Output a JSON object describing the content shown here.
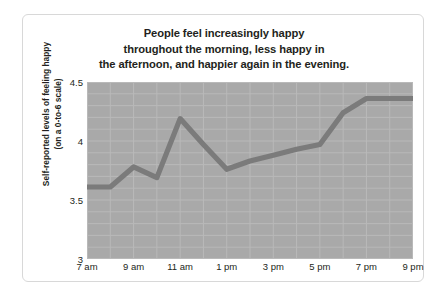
{
  "chart_data": {
    "type": "line",
    "title": "People feel increasingly happy throughout the morning, less happy in the afternoon, and happier again in the evening.",
    "title_lines": [
      "People feel increasingly happy",
      "throughout the morning, less happy in",
      "the afternoon, and happier again in the evening."
    ],
    "xlabel": "",
    "ylabel": "Self-reported levels of feeling happy (on a 0-to-6 scale)",
    "ylabel_lines": [
      "Self-reported levels of feeling happy",
      "(on a 0-to-6 scale)"
    ],
    "x": [
      "7 am",
      "8 am",
      "9 am",
      "10 am",
      "11 am",
      "12 pm",
      "1 pm",
      "2 pm",
      "3 pm",
      "4 pm",
      "5 pm",
      "6 pm",
      "7 pm",
      "8 pm",
      "9 pm"
    ],
    "values": [
      3.61,
      3.61,
      3.78,
      3.69,
      4.19,
      3.97,
      3.76,
      3.83,
      3.88,
      3.93,
      3.97,
      4.24,
      4.36,
      4.36,
      4.36
    ],
    "xtick_labels": [
      "7 am",
      "9 am",
      "11 am",
      "1 pm",
      "3 pm",
      "5 pm",
      "7 pm",
      "9 pm"
    ],
    "xtick_indices": [
      0,
      2,
      4,
      6,
      8,
      10,
      12,
      14
    ],
    "ytick_labels": [
      "4.5",
      "4",
      "3.5",
      "3"
    ],
    "ytick_values": [
      4.5,
      4,
      3.5,
      3
    ],
    "ylim": [
      3,
      4.5
    ],
    "xlim": [
      0,
      14
    ],
    "grid": true,
    "legend": false,
    "series_name": "Self-reported happiness",
    "colors": {
      "line": "#7b7b7b",
      "plot_background": "#a9a9a9",
      "gridline": "#b9b9b9",
      "figure_background": "#ffffff",
      "figure_border": "#d8d8d8",
      "text": "#231f20"
    }
  }
}
